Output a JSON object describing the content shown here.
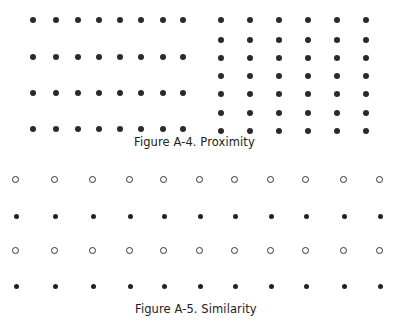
{
  "figure_a4": {
    "caption": "Figure A-4.  Proximity",
    "left_grid": {
      "rows": 4,
      "cols": 8,
      "xs": [
        33,
        56,
        78,
        99,
        120,
        141,
        163,
        183
      ],
      "ys": [
        20,
        57,
        93,
        129
      ],
      "style": "filled"
    },
    "right_grid": {
      "rows": 7,
      "cols": 6,
      "xs": [
        221,
        250,
        279,
        308,
        337,
        366
      ],
      "ys": [
        20,
        40,
        58,
        76,
        94,
        113,
        131
      ],
      "style": "filled"
    }
  },
  "figure_a5": {
    "caption": "Figure A-5.  Similarity",
    "grid": {
      "cols": 11,
      "xs": [
        16,
        55,
        93,
        130,
        164,
        200,
        235,
        271,
        306,
        344,
        380
      ],
      "rows": [
        {
          "y": 180,
          "style": "ring"
        },
        {
          "y": 216,
          "style": "small"
        },
        {
          "y": 251,
          "style": "ring"
        },
        {
          "y": 286,
          "style": "small"
        }
      ]
    }
  },
  "colors": {
    "dot": "#2a2a2a",
    "text": "#222222",
    "background": "#ffffff"
  }
}
